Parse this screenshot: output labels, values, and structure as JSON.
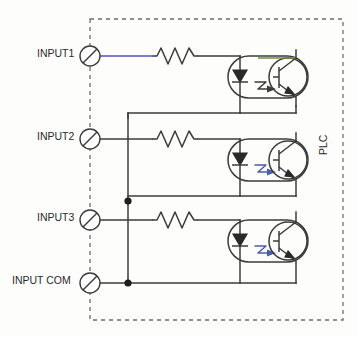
{
  "diagram": {
    "enclosure_label": "PLC",
    "enclosure_style": "dashed-rectangle",
    "terminals": [
      {
        "id": "input1",
        "label": "INPUT1",
        "y": 56
      },
      {
        "id": "input2",
        "label": "INPUT2",
        "y": 139
      },
      {
        "id": "input3",
        "label": "INPUT3",
        "y": 220
      },
      {
        "id": "inputcom",
        "label": "INPUT COM",
        "y": 283
      }
    ],
    "channels": [
      {
        "id": "channel-1",
        "input": "INPUT1",
        "resistor": "resistor-1",
        "optocoupler": "optocoupler-1"
      },
      {
        "id": "channel-2",
        "input": "INPUT2",
        "resistor": "resistor-2",
        "optocoupler": "optocoupler-2"
      },
      {
        "id": "channel-3",
        "input": "INPUT3",
        "resistor": "resistor-3",
        "optocoupler": "optocoupler-3"
      }
    ],
    "components": {
      "resistor_name": "resistor",
      "led_name": "led",
      "phototransistor_name": "phototransistor",
      "optocoupler_name": "optocoupler",
      "light_arrow_name": "light-emission-arrow",
      "junction_name": "junction-dot",
      "terminal_name": "terminal"
    },
    "colors": {
      "wire": "#3b3b3b",
      "wire_highlight_blue": "#4f4fc0",
      "wire_highlight_green": "#6f8f3a",
      "light_arrow": "#4a5fa8",
      "border": "#6d6d6d",
      "text": "#2a2a2a",
      "background": "#fdfdfc"
    },
    "junctions": [
      {
        "id": "junction-common-mid",
        "x": 128,
        "y": 201
      },
      {
        "id": "junction-common-bot",
        "x": 128,
        "y": 283
      }
    ]
  }
}
